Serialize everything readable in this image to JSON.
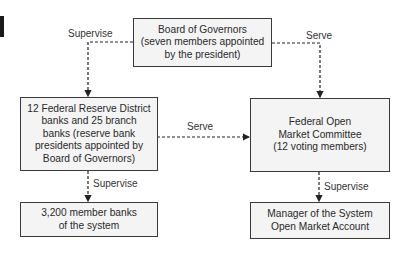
{
  "diagram": {
    "nodes": {
      "board": {
        "text": "Board of Governors\n(seven members appointed\nby the president)"
      },
      "district_banks": {
        "text": "12 Federal Reserve District\nbanks and 25 branch\nbanks (reserve bank\npresidents appointed by\nBoard of Governors)"
      },
      "fomc": {
        "text": "Federal Open\nMarket Committee\n(12 voting members)"
      },
      "member_banks": {
        "text": "3,200 member banks\nof the system"
      },
      "manager": {
        "text": "Manager of the System\nOpen Market Account"
      }
    },
    "edges": {
      "board_to_district": {
        "label": "Supervise"
      },
      "board_to_fomc": {
        "label": "Serve"
      },
      "district_to_fomc": {
        "label": "Serve"
      },
      "district_to_members": {
        "label": "Supervise"
      },
      "fomc_to_manager": {
        "label": "Supervise"
      }
    }
  }
}
